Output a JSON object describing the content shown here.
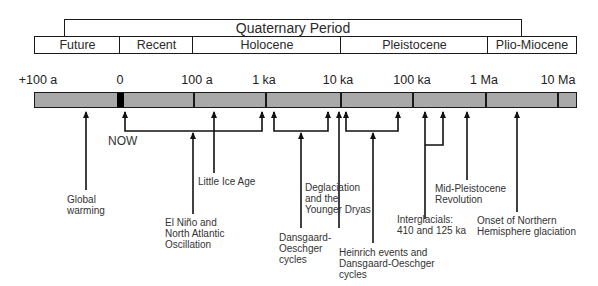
{
  "periods": {
    "top": {
      "label": "Quaternary Period",
      "x1": 64,
      "x2": 521
    },
    "sub": [
      {
        "label": "Future",
        "x1": 34,
        "x2": 120
      },
      {
        "label": "Recent",
        "x1": 120,
        "x2": 193
      },
      {
        "label": "Holocene",
        "x1": 193,
        "x2": 341
      },
      {
        "label": "Pleistocene",
        "x1": 341,
        "x2": 488
      },
      {
        "label": "Plio-Miocene",
        "x1": 488,
        "x2": 577
      }
    ]
  },
  "scale": {
    "ticks": [
      {
        "label": "+100 a",
        "x": 38
      },
      {
        "label": "0",
        "x": 120
      },
      {
        "label": "100 a",
        "x": 197
      },
      {
        "label": "1 ka",
        "x": 265
      },
      {
        "label": "10 ka",
        "x": 340
      },
      {
        "label": "100 ka",
        "x": 412
      },
      {
        "label": "1 Ma",
        "x": 485
      },
      {
        "label": "10 Ma",
        "x": 557
      }
    ],
    "bar_color": "#a9a9a9",
    "now_marker_color": "#000000"
  },
  "now_label": "NOW",
  "events": [
    {
      "label": [
        "Global",
        "warming"
      ]
    },
    {
      "label": [
        "El Niño and",
        "North Atlantic",
        "Oscillation"
      ]
    },
    {
      "label": [
        "Little Ice Age"
      ]
    },
    {
      "label": [
        "Dansgaard-",
        "Oeschger",
        "cycles"
      ]
    },
    {
      "label": [
        "Deglaciation",
        "and the",
        "Younger Dryas"
      ]
    },
    {
      "label": [
        "Heinrich events and",
        "Dansgaard-Oeschger",
        "cycles"
      ]
    },
    {
      "label": [
        "Interglacials:",
        "410 and 125 ka"
      ]
    },
    {
      "label": [
        "Mid-Pleistocene",
        "Revolution"
      ]
    },
    {
      "label": [
        "Onset of Northern",
        "Hemisphere glaciation"
      ]
    }
  ]
}
